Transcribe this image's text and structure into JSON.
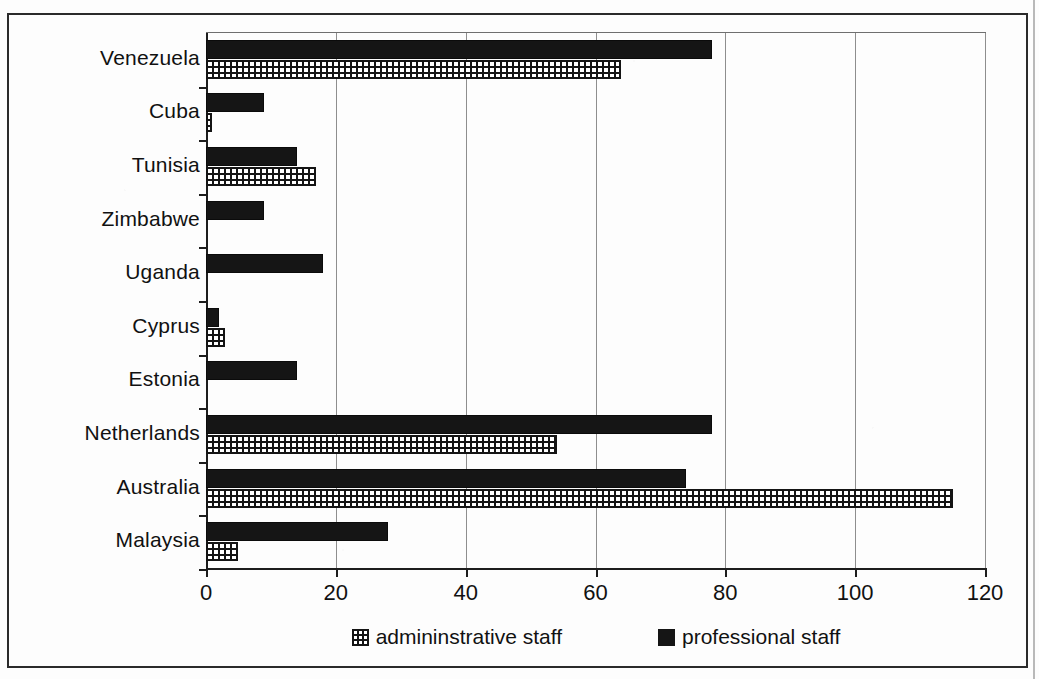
{
  "chart_data": {
    "type": "bar",
    "orientation": "horizontal",
    "title": "",
    "xlabel": "",
    "ylabel": "",
    "xlim": [
      0,
      120
    ],
    "xticks": [
      0,
      20,
      40,
      60,
      80,
      100,
      120
    ],
    "xtick_labels": [
      "0",
      "20",
      "40",
      "60",
      "80",
      "100",
      "120"
    ],
    "grid": true,
    "grid_axis": "x",
    "legend_position": "bottom",
    "categories": [
      "Venezuela",
      "Cuba",
      "Tunisia",
      "Zimbabwe",
      "Uganda",
      "Cyprus",
      "Estonia",
      "Netherlands",
      "Australia",
      "Malaysia"
    ],
    "series": [
      {
        "name": "professional staff",
        "color": "#151515",
        "pattern": "solid",
        "values": [
          78,
          9,
          14,
          9,
          18,
          2,
          14,
          78,
          74,
          28
        ]
      },
      {
        "name": "admininstrative staff",
        "color": "#141414",
        "pattern": "checkered",
        "values": [
          64,
          1,
          17,
          0,
          0,
          3,
          0,
          54,
          115,
          5
        ]
      }
    ]
  },
  "legend": {
    "items": [
      {
        "label": "admininstrative staff",
        "swatch": "checkered-swatch-icon"
      },
      {
        "label": "professional staff",
        "swatch": "solid-swatch-icon"
      }
    ]
  }
}
